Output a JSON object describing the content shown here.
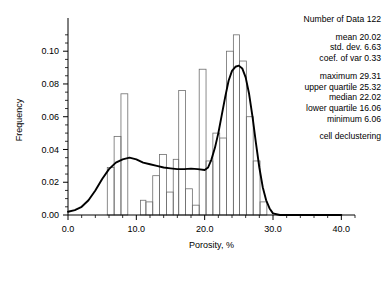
{
  "chart_data": {
    "type": "bar",
    "title": "",
    "xlabel": "Porosity, %",
    "ylabel": "Frequency",
    "xlim": [
      0.0,
      42.0
    ],
    "ylim": [
      0.0,
      0.116
    ],
    "xticks": [
      "0.0",
      "10.0",
      "20.0",
      "30.0",
      "40.0"
    ],
    "xtick_values": [
      0,
      10,
      20,
      30,
      40
    ],
    "yticks": [
      "0.00",
      "0.02",
      "0.04",
      "0.06",
      "0.08",
      "0.10"
    ],
    "ytick_values": [
      0.0,
      0.02,
      0.04,
      0.06,
      0.08,
      0.1
    ],
    "grid": false,
    "legend": "none",
    "bin_width": 1.0,
    "categories": [
      6,
      7,
      8,
      9,
      11,
      12,
      13,
      14,
      15,
      16,
      17,
      18,
      19,
      20,
      21,
      22,
      23,
      24,
      25,
      26,
      27,
      28
    ],
    "values": [
      0.029,
      0.048,
      0.074,
      0.0,
      0.009,
      0.008,
      0.024,
      0.037,
      0.014,
      0.034,
      0.076,
      0.016,
      0.006,
      0.089,
      0.033,
      0.05,
      0.047,
      0.1,
      0.11,
      0.094,
      0.06,
      0.033
    ],
    "bars": [
      {
        "x0": 5.75,
        "x1": 6.75,
        "y": 0.029
      },
      {
        "x0": 6.75,
        "x1": 7.75,
        "y": 0.048
      },
      {
        "x0": 7.75,
        "x1": 8.75,
        "y": 0.074
      },
      {
        "x0": 10.6,
        "x1": 11.4,
        "y": 0.009
      },
      {
        "x0": 11.4,
        "x1": 12.4,
        "y": 0.008
      },
      {
        "x0": 12.4,
        "x1": 13.4,
        "y": 0.024
      },
      {
        "x0": 13.4,
        "x1": 14.4,
        "y": 0.037
      },
      {
        "x0": 14.4,
        "x1": 15.4,
        "y": 0.014
      },
      {
        "x0": 15.4,
        "x1": 16.2,
        "y": 0.034
      },
      {
        "x0": 16.2,
        "x1": 17.2,
        "y": 0.076
      },
      {
        "x0": 17.2,
        "x1": 18.2,
        "y": 0.016
      },
      {
        "x0": 18.2,
        "x1": 19.2,
        "y": 0.006
      },
      {
        "x0": 19.2,
        "x1": 20.2,
        "y": 0.089
      },
      {
        "x0": 20.2,
        "x1": 21.2,
        "y": 0.033
      },
      {
        "x0": 21.2,
        "x1": 22.2,
        "y": 0.05
      },
      {
        "x0": 22.2,
        "x1": 23.2,
        "y": 0.047
      },
      {
        "x0": 23.2,
        "x1": 24.2,
        "y": 0.1
      },
      {
        "x0": 24.2,
        "x1": 25.1,
        "y": 0.11
      },
      {
        "x0": 25.1,
        "x1": 26.1,
        "y": 0.094
      },
      {
        "x0": 26.1,
        "x1": 27.1,
        "y": 0.06
      },
      {
        "x0": 27.1,
        "x1": 28.1,
        "y": 0.033
      },
      {
        "x0": 28.1,
        "x1": 29.1,
        "y": 0.008
      }
    ],
    "curve_label": "smoothed distribution",
    "curve": [
      [
        0.0,
        0.002
      ],
      [
        1.0,
        0.003
      ],
      [
        2.0,
        0.005
      ],
      [
        3.0,
        0.009
      ],
      [
        4.0,
        0.015
      ],
      [
        5.0,
        0.022
      ],
      [
        6.0,
        0.028
      ],
      [
        7.0,
        0.032
      ],
      [
        8.0,
        0.034
      ],
      [
        9.0,
        0.035
      ],
      [
        10.0,
        0.034
      ],
      [
        11.0,
        0.032
      ],
      [
        12.0,
        0.031
      ],
      [
        13.0,
        0.03
      ],
      [
        14.0,
        0.029
      ],
      [
        15.0,
        0.0285
      ],
      [
        16.0,
        0.028
      ],
      [
        17.0,
        0.028
      ],
      [
        18.0,
        0.0283
      ],
      [
        19.0,
        0.028
      ],
      [
        20.0,
        0.0275
      ],
      [
        20.5,
        0.029
      ],
      [
        21.0,
        0.034
      ],
      [
        21.5,
        0.041
      ],
      [
        22.0,
        0.05
      ],
      [
        22.5,
        0.061
      ],
      [
        23.0,
        0.072
      ],
      [
        23.5,
        0.082
      ],
      [
        24.0,
        0.088
      ],
      [
        24.5,
        0.0905
      ],
      [
        25.0,
        0.0912
      ],
      [
        25.5,
        0.0895
      ],
      [
        26.0,
        0.084
      ],
      [
        26.5,
        0.074
      ],
      [
        27.0,
        0.06
      ],
      [
        27.5,
        0.044
      ],
      [
        28.0,
        0.029
      ],
      [
        28.5,
        0.017
      ],
      [
        29.0,
        0.009
      ],
      [
        29.5,
        0.004
      ],
      [
        30.0,
        0.001
      ],
      [
        31.0,
        0.0
      ],
      [
        34.0,
        0.0
      ],
      [
        40.0,
        0.0
      ]
    ]
  },
  "stats": {
    "lines": [
      {
        "label": "Number of Data",
        "value": "122"
      },
      {
        "label": "mean",
        "value": "20.02"
      },
      {
        "label": "std. dev.",
        "value": "6.63"
      },
      {
        "label": "coef. of var",
        "value": "0.33"
      },
      {
        "label": "maximum",
        "value": "29.31"
      },
      {
        "label": "upper quartile",
        "value": "25.32"
      },
      {
        "label": "median",
        "value": "22.02"
      },
      {
        "label": "lower quartile",
        "value": "16.06"
      },
      {
        "label": "minimum",
        "value": "6.06"
      }
    ],
    "note": "cell declustering"
  },
  "colors": {
    "axis": "#000000",
    "bar_stroke": "#6e6e6e",
    "curve": "#000000",
    "background": "#ffffff"
  }
}
